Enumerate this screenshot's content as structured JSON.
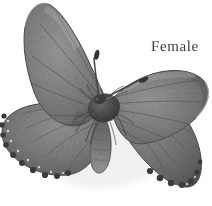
{
  "plate": {
    "background_color": "#ffffff",
    "width": 212,
    "height": 206,
    "medium": "halftone-engraving",
    "palette": {
      "wing_mid_gray": "#6e6e6e",
      "wing_dark_gray": "#4a4a4a",
      "wing_light_gray": "#9a9a9a",
      "outline_black": "#1c1c1c",
      "body_black": "#262626",
      "fringe_white": "#f2f2f2",
      "label_gray": "#3a3a3a"
    }
  },
  "label": {
    "sex_label": "Female"
  },
  "specimen": {
    "name": "butterfly-specimen",
    "view": "dorsal",
    "parts": {
      "forewing_left": "forewing-left",
      "forewing_right": "forewing-right",
      "hindwing_left": "hindwing-left",
      "hindwing_right": "hindwing-right",
      "thorax": "thorax",
      "abdomen": "abdomen",
      "antenna_left": "antenna-left",
      "antenna_right": "antenna-right"
    }
  }
}
